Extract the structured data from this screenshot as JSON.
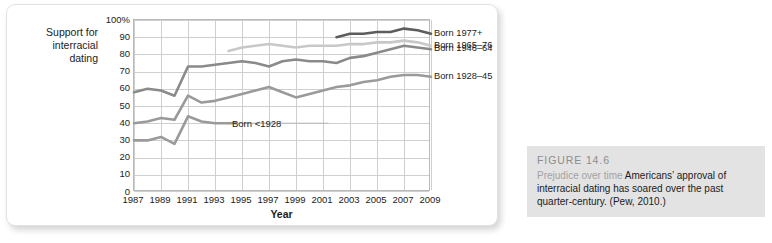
{
  "figure": {
    "caption_title": "FIGURE 14.6",
    "caption_lead": "Prejudice over time",
    "caption_body": "Americans’ approval of interracial dating has soared over the past quarter-century. (Pew, 2010.)"
  },
  "axis": {
    "y_title": "Support for\ninterracial\ndating",
    "x_title": "Year",
    "y_ticks": [
      "100%",
      "90",
      "80",
      "70",
      "60",
      "50",
      "40",
      "30",
      "20",
      "10",
      "0"
    ],
    "x_ticks": [
      "1987",
      "1989",
      "1991",
      "1993",
      "1995",
      "1997",
      "1999",
      "2001",
      "2003",
      "2005",
      "2007",
      "2009"
    ]
  },
  "inline_labels": {
    "born_lt_1928": "Born <1928"
  },
  "legend": {
    "items": [
      {
        "label": "Born 1977+",
        "color": "#5d5d5d"
      },
      {
        "label": "Born 1965–76",
        "color": "#c8c8c8"
      },
      {
        "label": "Born 1946–64",
        "color": "#8a8a8a"
      },
      {
        "label": "Born 1928–45",
        "color": "#9a9a9a"
      }
    ]
  },
  "chart_data": {
    "type": "line",
    "title": "Prejudice over time",
    "xlabel": "Year",
    "ylabel": "Support for interracial dating",
    "xlim": [
      1987,
      2009
    ],
    "ylim": [
      0,
      100
    ],
    "grid": true,
    "legend_position": "right",
    "x": [
      1987,
      1988,
      1989,
      1990,
      1991,
      1992,
      1993,
      1994,
      1995,
      1996,
      1997,
      1998,
      1999,
      2000,
      2001,
      2002,
      2003,
      2004,
      2005,
      2006,
      2007,
      2008,
      2009
    ],
    "series": [
      {
        "name": "Born 1977+",
        "color": "#5d5d5d",
        "x": [
          2002,
          2003,
          2004,
          2005,
          2006,
          2007,
          2008,
          2009
        ],
        "values": [
          90,
          92,
          92,
          93,
          93,
          95,
          94,
          92
        ]
      },
      {
        "name": "Born 1965–76",
        "color": "#c8c8c8",
        "x": [
          1994,
          1995,
          1996,
          1997,
          1998,
          1999,
          2000,
          2001,
          2002,
          2003,
          2004,
          2005,
          2006,
          2007,
          2008,
          2009
        ],
        "values": [
          82,
          84,
          85,
          86,
          85,
          84,
          85,
          85,
          85,
          86,
          86,
          87,
          87,
          88,
          87,
          85
        ]
      },
      {
        "name": "Born 1946–64",
        "color": "#8a8a8a",
        "x": [
          1987,
          1988,
          1989,
          1990,
          1991,
          1992,
          1993,
          1994,
          1995,
          1996,
          1997,
          1998,
          1999,
          2000,
          2001,
          2002,
          2003,
          2004,
          2005,
          2006,
          2007,
          2008,
          2009
        ],
        "values": [
          58,
          60,
          59,
          56,
          73,
          73,
          74,
          75,
          76,
          75,
          73,
          76,
          77,
          76,
          76,
          75,
          78,
          79,
          81,
          83,
          85,
          84,
          83
        ]
      },
      {
        "name": "Born 1928–45",
        "color": "#9a9a9a",
        "x": [
          1987,
          1988,
          1989,
          1990,
          1991,
          1992,
          1993,
          1994,
          1995,
          1996,
          1997,
          1998,
          1999,
          2000,
          2001,
          2002,
          2003,
          2004,
          2005,
          2006,
          2007,
          2008,
          2009
        ],
        "values": [
          40,
          41,
          43,
          42,
          56,
          52,
          53,
          55,
          57,
          59,
          61,
          58,
          55,
          57,
          59,
          61,
          62,
          64,
          65,
          67,
          68,
          68,
          67
        ]
      },
      {
        "name": "Born <1928",
        "color": "#9a9a9a",
        "x": [
          1987,
          1988,
          1989,
          1990,
          1991,
          1992,
          1993,
          1994
        ],
        "values": [
          30,
          30,
          32,
          28,
          44,
          41,
          40,
          40
        ]
      }
    ]
  }
}
